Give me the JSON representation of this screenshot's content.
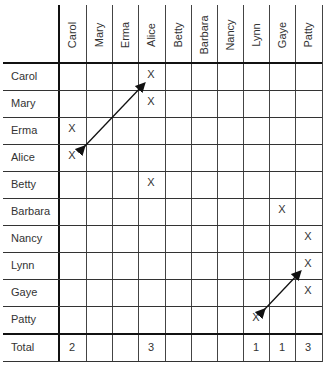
{
  "columns": [
    "Carol",
    "Mary",
    "Erma",
    "Alice",
    "Betty",
    "Barbara",
    "Nancy",
    "Lynn",
    "Gaye",
    "Patty"
  ],
  "rows": [
    {
      "label": "Carol",
      "marks": [
        "",
        "",
        "",
        "X",
        "",
        "",
        "",
        "",
        "",
        ""
      ]
    },
    {
      "label": "Mary",
      "marks": [
        "",
        "",
        "",
        "X",
        "",
        "",
        "",
        "",
        "",
        ""
      ]
    },
    {
      "label": "Erma",
      "marks": [
        "X",
        "",
        "",
        "",
        "",
        "",
        "",
        "",
        "",
        ""
      ]
    },
    {
      "label": "Alice",
      "marks": [
        "X",
        "",
        "",
        "",
        "",
        "",
        "",
        "",
        "",
        ""
      ]
    },
    {
      "label": "Betty",
      "marks": [
        "",
        "",
        "",
        "X",
        "",
        "",
        "",
        "",
        "",
        ""
      ]
    },
    {
      "label": "Barbara",
      "marks": [
        "",
        "",
        "",
        "",
        "",
        "",
        "",
        "",
        "X",
        ""
      ]
    },
    {
      "label": "Nancy",
      "marks": [
        "",
        "",
        "",
        "",
        "",
        "",
        "",
        "",
        "",
        "X"
      ]
    },
    {
      "label": "Lynn",
      "marks": [
        "",
        "",
        "",
        "",
        "",
        "",
        "",
        "",
        "",
        "X"
      ]
    },
    {
      "label": "Gaye",
      "marks": [
        "",
        "",
        "",
        "",
        "",
        "",
        "",
        "",
        "",
        "X"
      ]
    },
    {
      "label": "Patty",
      "marks": [
        "",
        "",
        "",
        "",
        "",
        "",
        "",
        "X",
        "",
        ""
      ]
    }
  ],
  "total": {
    "label": "Total",
    "values": [
      "2",
      "",
      "",
      "3",
      "",
      "",
      "",
      "1",
      "1",
      "3"
    ]
  },
  "arrows": [
    {
      "description": "double-headed arrow between Carol/Alice mark and Alice/Carol mark"
    },
    {
      "description": "double-headed arrow between Lynn/Patty mark and Patty/Lynn mark"
    }
  ]
}
